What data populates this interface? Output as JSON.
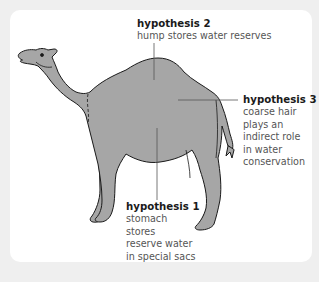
{
  "diagram": {
    "colors": {
      "background": "#efefef",
      "card": "#ffffff",
      "camel_fill": "#a6a6a6",
      "outline": "#1a1a1a",
      "leader_line": "#555555",
      "title_text": "#1a1a1a",
      "body_text": "#555555"
    },
    "hypotheses": {
      "h2": {
        "title": "hypothesis 2",
        "lines": [
          "hump stores water reserves"
        ]
      },
      "h3": {
        "title": "hypothesis 3",
        "lines": [
          "coarse hair",
          "plays an",
          "indirect role",
          "in water",
          "conservation"
        ]
      },
      "h1": {
        "title": "hypothesis 1",
        "lines": [
          "stomach",
          "stores",
          "reserve water",
          "in special sacs"
        ]
      }
    }
  }
}
